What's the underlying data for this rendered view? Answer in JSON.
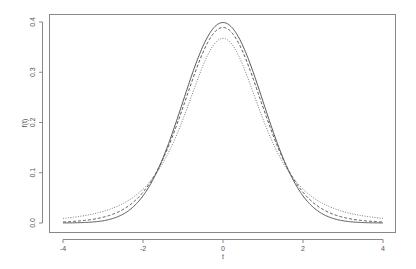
{
  "chart_data": {
    "type": "line",
    "title": "",
    "xlabel": "t",
    "ylabel": "f(t)",
    "xlim": [
      -4,
      4
    ],
    "ylim": [
      0,
      0.4
    ],
    "grid": false,
    "legend": null,
    "x_ticks": [
      "-4",
      "-2",
      "0",
      "2",
      "4"
    ],
    "y_ticks": [
      "0.0",
      "0.1",
      "0.2",
      "0.3",
      "0.4"
    ],
    "series": [
      {
        "name": "standard normal density",
        "style": "solid",
        "color": "#555555",
        "x": [
          -4,
          -3,
          -2,
          -1.5,
          -1,
          -0.5,
          0,
          0.5,
          1,
          1.5,
          2,
          3,
          4
        ],
        "y": [
          0.0001,
          0.0044,
          0.054,
          0.1295,
          0.242,
          0.3521,
          0.3989,
          0.3521,
          0.242,
          0.1295,
          0.054,
          0.0044,
          0.0001
        ]
      },
      {
        "name": "t density (df=10)",
        "style": "dashed",
        "color": "#555555",
        "x": [
          -4,
          -3,
          -2,
          -1.5,
          -1,
          -0.5,
          0,
          0.5,
          1,
          1.5,
          2,
          3,
          4
        ],
        "y": [
          0.0028,
          0.0114,
          0.0611,
          0.1274,
          0.2304,
          0.3402,
          0.3891,
          0.3402,
          0.2304,
          0.1274,
          0.0611,
          0.0114,
          0.0028
        ]
      },
      {
        "name": "t density (df=3)",
        "style": "dotted",
        "color": "#777777",
        "x": [
          -4,
          -3,
          -2,
          -1.5,
          -1,
          -0.5,
          0,
          0.5,
          1,
          1.5,
          2,
          3,
          4
        ],
        "y": [
          0.0092,
          0.0229,
          0.0675,
          0.1274,
          0.2067,
          0.3125,
          0.3676,
          0.3125,
          0.2067,
          0.1274,
          0.0675,
          0.0229,
          0.0092
        ]
      }
    ]
  }
}
